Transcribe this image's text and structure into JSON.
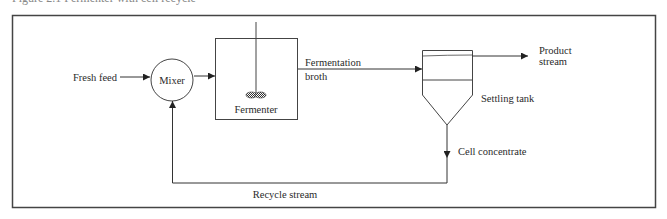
{
  "caption": "Figure 2.1    Fermenter with cell recycle",
  "diagram": {
    "nodes": {
      "mixer": "Mixer",
      "fermenter": "Fermenter",
      "settling_tank": "Settling tank"
    },
    "streams": {
      "fresh_feed": "Fresh feed",
      "fermentation_broth_line1": "Fermentation",
      "fermentation_broth_line2": "broth",
      "product_stream_line1": "Product",
      "product_stream_line2": "stream",
      "cell_concentrate": "Cell concentrate",
      "recycle_stream": "Recycle stream"
    },
    "colors": {
      "line": "#333333",
      "border": "#444444",
      "background": "#ffffff"
    }
  }
}
